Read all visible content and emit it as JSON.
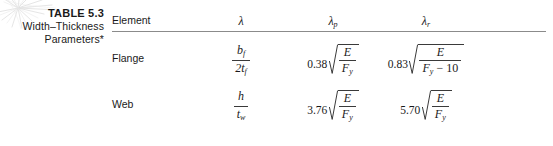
{
  "figure": {
    "caption": {
      "table_number": "TABLE 5.3",
      "line2": "Width–Thickness",
      "line3": "Parameters*"
    },
    "decoration": {
      "icon": "starburst-icon",
      "color": "#c9c9c9"
    }
  },
  "table": {
    "headers": {
      "element": "Element",
      "lambda": "λ",
      "lambda_p_symbol": "λ",
      "lambda_p_sub": "p",
      "lambda_r_symbol": "λ",
      "lambda_r_sub": "r"
    },
    "rows": [
      {
        "element": "Flange",
        "lambda": {
          "numerator": "b",
          "numerator_sub": "f",
          "denominator_prefix": "2t",
          "denominator_sub": "f"
        },
        "lambda_p": {
          "coefficient": "0.38",
          "radicand_num": "E",
          "radicand_den": "F",
          "radicand_den_sub": "y",
          "radicand_den_extra": ""
        },
        "lambda_r": {
          "coefficient": "0.83",
          "radicand_num": "E",
          "radicand_den": "F",
          "radicand_den_sub": "y",
          "radicand_den_extra": "− 10"
        }
      },
      {
        "element": "Web",
        "lambda": {
          "numerator": "h",
          "numerator_sub": "",
          "denominator_prefix": "t",
          "denominator_sub": "w"
        },
        "lambda_p": {
          "coefficient": "3.76",
          "radicand_num": "E",
          "radicand_den": "F",
          "radicand_den_sub": "y",
          "radicand_den_extra": ""
        },
        "lambda_r": {
          "coefficient": "5.70",
          "radicand_num": "E",
          "radicand_den": "F",
          "radicand_den_sub": "y",
          "radicand_den_extra": ""
        }
      }
    ]
  },
  "style": {
    "rule_color": "#8b8b8b",
    "text_color": "#231f20",
    "background": "#ffffff"
  }
}
